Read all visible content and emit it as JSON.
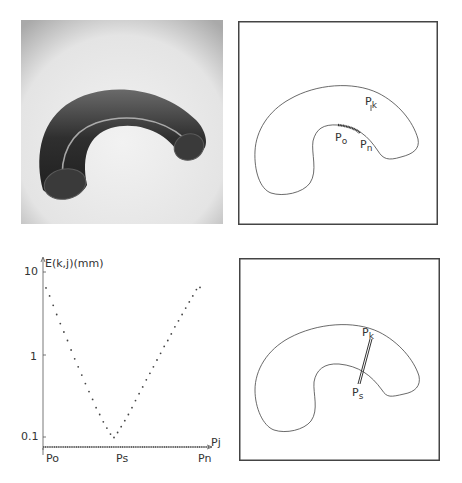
{
  "figure": {
    "panels": [
      {
        "id": "photo",
        "description": "Rendered 3D curved tube (bent cylinder) on light gray background"
      },
      {
        "id": "outline-top",
        "labels": {
          "pk": "P",
          "pk_sub": "k",
          "po": "P",
          "po_sub": "o",
          "pn": "P",
          "pn_sub": "n"
        }
      },
      {
        "id": "graph"
      },
      {
        "id": "outline-bottom",
        "labels": {
          "pk": "P",
          "pk_sub": "k",
          "ps": "P",
          "ps_sub": "s"
        }
      }
    ]
  },
  "graph": {
    "ylabel": "E(k,j)(mm)",
    "xlabel": "Pj",
    "yticks": [
      "10",
      "1",
      "0.1"
    ],
    "xticks": [
      "Po",
      "Ps",
      "Pn"
    ]
  },
  "chart_data": {
    "type": "scatter",
    "title": "",
    "xlabel": "Pj",
    "ylabel": "E(k,j)(mm)",
    "yscale": "log",
    "ylim": [
      0.07,
      12
    ],
    "x_tick_labels": [
      "Po",
      "Ps",
      "Pn"
    ],
    "y_tick_labels": [
      "0.1",
      "1",
      "10"
    ],
    "grid": false,
    "legend": null,
    "series": [
      {
        "name": "E(k,j)",
        "x": [
          0,
          1,
          2,
          3,
          4,
          5,
          6,
          7,
          8,
          9,
          10,
          11,
          12,
          13,
          14,
          15,
          16,
          17,
          18,
          19,
          20,
          21,
          22,
          23,
          24,
          25,
          26,
          27,
          28,
          29,
          30,
          31,
          32,
          33,
          34,
          35,
          36,
          37,
          38,
          39,
          40,
          41,
          42,
          43,
          44,
          45,
          46,
          47,
          48,
          49
        ],
        "values": [
          6.5,
          5.2,
          4.0,
          3.1,
          2.4,
          1.9,
          1.5,
          1.15,
          0.9,
          0.72,
          0.57,
          0.45,
          0.36,
          0.29,
          0.23,
          0.19,
          0.155,
          0.13,
          0.11,
          0.1,
          0.115,
          0.135,
          0.16,
          0.19,
          0.23,
          0.28,
          0.34,
          0.41,
          0.5,
          0.6,
          0.72,
          0.87,
          1.05,
          1.27,
          1.5,
          1.8,
          2.2,
          2.6,
          3.1,
          3.7,
          4.4,
          5.2,
          6.2,
          6.6,
          null,
          null,
          null,
          null,
          null,
          null
        ]
      }
    ]
  }
}
